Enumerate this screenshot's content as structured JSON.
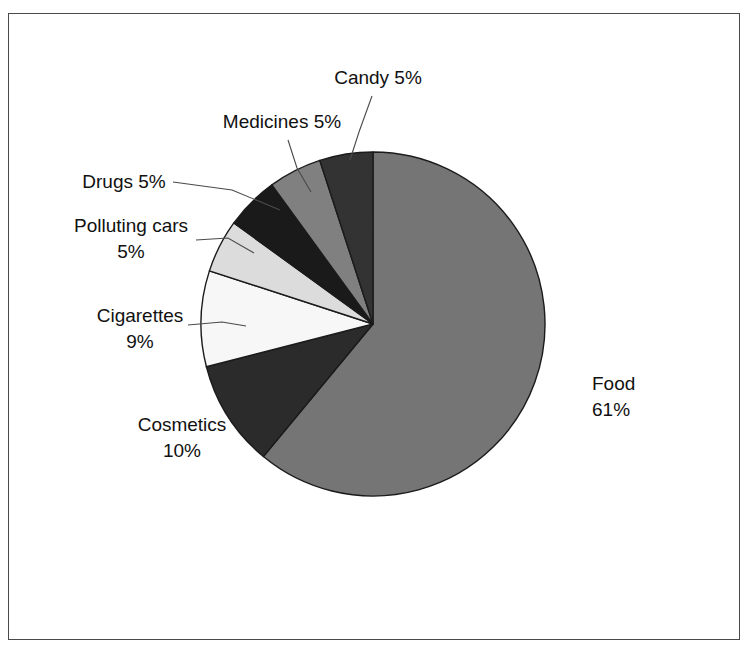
{
  "figure": {
    "background_color": "#ffffff",
    "frame_color": "#4a4a4a",
    "label_color": "#111111",
    "leader_color": "#4a4a4a",
    "slice_outline_color": "#1b1b1b"
  },
  "chart_data": {
    "type": "pie",
    "title": "",
    "subtitle": "",
    "xlabel": "",
    "ylabel": "",
    "grid": false,
    "legend_position": "none",
    "label_format": "{name} {value}%",
    "start_angle_deg": 0,
    "direction": "clockwise",
    "center": {
      "x": 373,
      "y": 324
    },
    "radius": 172,
    "total": 100,
    "categories": [
      "Food",
      "Cosmetics",
      "Cigarettes",
      "Polluting cars",
      "Drugs",
      "Medicines",
      "Candy"
    ],
    "values": [
      61,
      10,
      9,
      5,
      5,
      5,
      5
    ],
    "colors": [
      "#757575",
      "#2b2b2b",
      "#f7f7f7",
      "#dcdcdc",
      "#1a1a1a",
      "#808080",
      "#333333"
    ],
    "slices": [
      {
        "name": "Food",
        "value": 61,
        "value_text": "61%",
        "color": "#757575",
        "label_lines": [
          "Food",
          "61%"
        ],
        "label_x": 592,
        "label_y": 390,
        "label_anchor": "start",
        "has_leader": false
      },
      {
        "name": "Cosmetics",
        "value": 10,
        "value_text": "10%",
        "color": "#2b2b2b",
        "label_lines": [
          "Cosmetics",
          "10%"
        ],
        "label_x": 182,
        "label_y": 431,
        "label_anchor": "middle",
        "has_leader": false
      },
      {
        "name": "Cigarettes",
        "value": 9,
        "value_text": "9%",
        "color": "#f7f7f7",
        "label_lines": [
          "Cigarettes",
          "9%"
        ],
        "label_x": 140,
        "label_y": 322,
        "label_anchor": "middle",
        "has_leader": true,
        "leader_points": "188,325 222,322 246,326"
      },
      {
        "name": "Polluting cars",
        "value": 5,
        "value_text": "5%",
        "color": "#dcdcdc",
        "label_lines": [
          "Polluting cars",
          "5%"
        ],
        "label_x": 131,
        "label_y": 232,
        "label_anchor": "middle",
        "has_leader": true,
        "leader_points": "196,240 228,238 254,253"
      },
      {
        "name": "Drugs",
        "value": 5,
        "value_text": "5%",
        "color": "#1a1a1a",
        "label_lines": [
          "Drugs 5%"
        ],
        "label_x": 124,
        "label_y": 188,
        "label_anchor": "middle",
        "has_leader": true,
        "leader_points": "173,182 232,190 280,210"
      },
      {
        "name": "Medicines",
        "value": 5,
        "value_text": "5%",
        "color": "#808080",
        "label_lines": [
          "Medicines 5%"
        ],
        "label_x": 282,
        "label_y": 128,
        "label_anchor": "middle",
        "has_leader": true,
        "leader_points": "288,140 297,168 311,192"
      },
      {
        "name": "Candy",
        "value": 5,
        "value_text": "5%",
        "color": "#333333",
        "label_lines": [
          "Candy 5%"
        ],
        "label_x": 378,
        "label_y": 84,
        "label_anchor": "middle",
        "has_leader": true,
        "leader_points": "372,96 359,132 350,160"
      }
    ]
  }
}
